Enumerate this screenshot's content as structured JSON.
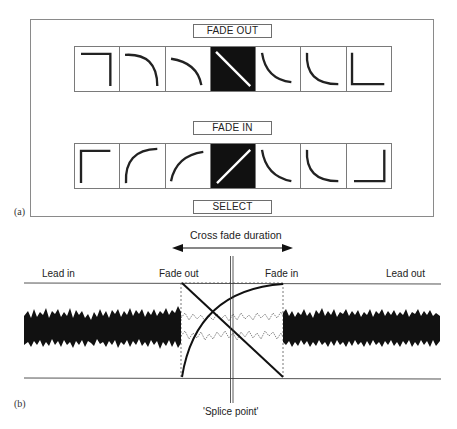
{
  "panel_a": {
    "caption": "(a)",
    "fade_out_label": "FADE OUT",
    "fade_in_label": "FADE IN",
    "select_label": "SELECT",
    "fade_out_curves": [
      "hard-cut",
      "slow-convex",
      "convex",
      "linear",
      "concave",
      "fast-concave",
      "hard-cut-end"
    ],
    "fade_in_curves": [
      "hard-cut",
      "fast-convex",
      "convex",
      "linear",
      "concave",
      "slow-concave",
      "hard-cut-end"
    ],
    "selected_index": 3
  },
  "panel_b": {
    "caption": "(b)",
    "crossfade_label": "Cross fade duration",
    "lead_in_label": "Lead in",
    "fade_out_label": "Fade out",
    "fade_in_label": "Fade in",
    "lead_out_label": "Lead out",
    "splice_label": "'Splice point'"
  },
  "colors": {
    "ink": "#111111",
    "frame": "#7a7a7a",
    "background": "#ffffff"
  }
}
